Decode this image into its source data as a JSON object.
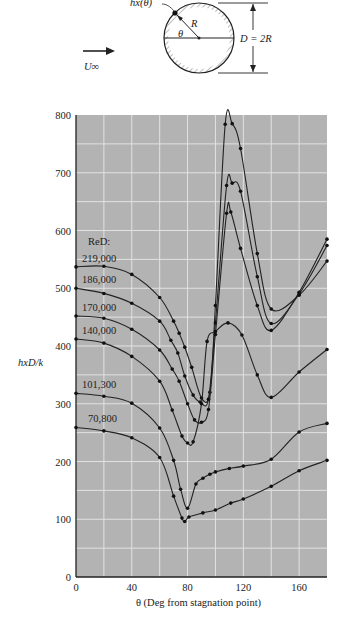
{
  "diagram": {
    "flow_label": "U∞",
    "heat_label": "hx(θ)",
    "radius_label": "R",
    "angle_label": "θ",
    "diameter_label": "D = 2R"
  },
  "chart_data": {
    "type": "line",
    "title": "",
    "xlabel": "θ (Deg from stagnation point)",
    "ylabel": "hxD/k",
    "xlim": [
      0,
      180
    ],
    "ylim": [
      0,
      800
    ],
    "xticks": [
      0,
      40,
      80,
      120,
      160
    ],
    "yticks": [
      0,
      100,
      200,
      300,
      400,
      500,
      600,
      700,
      800
    ],
    "grid": true,
    "grid_minor_x": 20,
    "grid_minor_y": 50,
    "legend_title": "ReD:",
    "legend_position": "inline-left",
    "series": [
      {
        "name": "219,000",
        "x": [
          0,
          20,
          40,
          60,
          70,
          74,
          78,
          83,
          90,
          96,
          100,
          107,
          112,
          118,
          130,
          140,
          160,
          180
        ],
        "y": [
          537,
          538,
          524,
          484,
          443,
          422,
          398,
          363,
          310,
          320,
          470,
          784,
          785,
          742,
          560,
          464,
          488,
          547
        ]
      },
      {
        "name": "186,000",
        "x": [
          0,
          20,
          40,
          60,
          68,
          73,
          78,
          84,
          89,
          95,
          100,
          108,
          112,
          118,
          130,
          140,
          160,
          180
        ],
        "y": [
          500,
          491,
          474,
          443,
          410,
          388,
          348,
          315,
          303,
          308,
          440,
          678,
          682,
          668,
          520,
          439,
          490,
          574
        ]
      },
      {
        "name": "170,000",
        "x": [
          0,
          20,
          40,
          60,
          69,
          74,
          80,
          85,
          90,
          95,
          100,
          108,
          111,
          118,
          130,
          140,
          160,
          180
        ],
        "y": [
          452,
          448,
          429,
          393,
          360,
          339,
          300,
          272,
          268,
          290,
          420,
          630,
          632,
          569,
          470,
          427,
          493,
          585
        ]
      },
      {
        "name": "140,000",
        "x": [
          0,
          20,
          40,
          60,
          69,
          76,
          80,
          84,
          90,
          94,
          100,
          109,
          119,
          130,
          140,
          160,
          180
        ],
        "y": [
          412,
          405,
          382,
          339,
          289,
          244,
          232,
          234,
          300,
          408,
          425,
          440,
          419,
          350,
          311,
          355,
          394
        ]
      },
      {
        "name": "101,300",
        "x": [
          0,
          20,
          40,
          60,
          70,
          75,
          80,
          86,
          91,
          96,
          100,
          110,
          120,
          140,
          160,
          180
        ],
        "y": [
          318,
          313,
          301,
          258,
          202,
          152,
          119,
          161,
          171,
          178,
          182,
          188,
          192,
          204,
          251,
          266
        ]
      },
      {
        "name": "70,800",
        "x": [
          0,
          20,
          40,
          60,
          70,
          76,
          78,
          81,
          91,
          100,
          111,
          120,
          140,
          160,
          180
        ],
        "y": [
          259,
          253,
          241,
          207,
          140,
          102,
          96,
          104,
          111,
          116,
          128,
          135,
          157,
          184,
          202
        ]
      }
    ]
  },
  "colors": {
    "plot_bg": "#b3b3b3",
    "grid": "#e2e2e2",
    "line": "#222222"
  }
}
